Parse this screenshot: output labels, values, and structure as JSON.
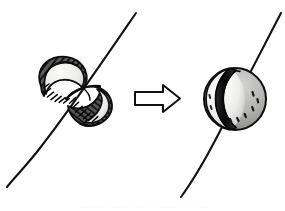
{
  "figure": {
    "background_color": "#ffffff",
    "width": 285,
    "height": 211,
    "caption_remnant": "........ .... ...... .. ...... ..... ........ ... ... ....",
    "colors": {
      "ink": "#1a1a1a",
      "outline": "#111111",
      "shell_dark": "#565656",
      "shell_mid": "#8f8f8f",
      "interior_light": "#e8e8e6",
      "highlight": "#f4f4f2",
      "hatch": "#000000",
      "paper": "#ffffff"
    }
  },
  "panels": {
    "left": {
      "name": "split-sphere",
      "label": "split sphere, two halves separated along the axis",
      "bbox": [
        38,
        58,
        74,
        72
      ],
      "axis_line": {
        "name": "axis-line-left",
        "x1": 136,
        "y1": 13,
        "x2": 7,
        "y2": 187
      },
      "upper_half": {
        "label": "upper-left half shell with light concave interior",
        "center": [
          64,
          82
        ]
      },
      "lower_half": {
        "label": "lower-right half shell with light concave interior",
        "center": [
          88,
          105
        ]
      }
    },
    "arrow": {
      "name": "transform-arrow",
      "label": "rightward transformation arrow",
      "direction": "right",
      "bbox": [
        134,
        84,
        47,
        29
      ]
    },
    "right": {
      "name": "whole-sphere",
      "label": "reassembled whole sphere with diagonal seam",
      "bbox": [
        204,
        68,
        62,
        62
      ],
      "axis_line": {
        "name": "axis-line-right",
        "x1": 281,
        "y1": 13,
        "x2": 181,
        "y2": 197
      },
      "seam": {
        "label": "diagonal seam band where the halves rejoin"
      }
    }
  }
}
